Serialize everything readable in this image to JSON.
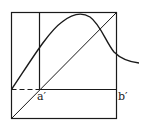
{
  "diagram": {
    "type": "function-iteration-plot",
    "labels": {
      "a_prime": "a′",
      "b_prime": "b′"
    },
    "colors": {
      "stroke": "#1a1a1a",
      "background": "#ffffff"
    },
    "elements": [
      "outer-square-box",
      "identity-diagonal",
      "vertical-line-at-a-prime",
      "horizontal-line",
      "dashed-segment",
      "humped-curve"
    ]
  }
}
